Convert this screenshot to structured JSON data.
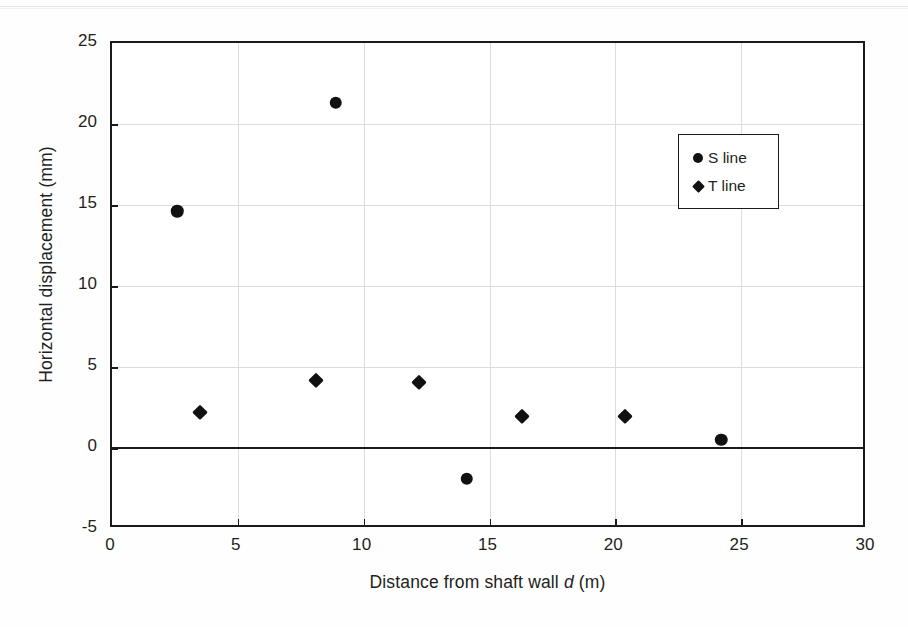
{
  "chart_data": {
    "type": "scatter",
    "title": "",
    "xlabel": "Distance from shaft wall d (m)",
    "xlabel_parts": {
      "pre": "Distance from shaft wall ",
      "italic": "d",
      "post": " (m)"
    },
    "ylabel": "Horizontal displacement (mm)",
    "xlim": [
      0,
      30
    ],
    "ylim": [
      -5,
      25
    ],
    "xticks": [
      "0",
      "5",
      "10",
      "15",
      "20",
      "25",
      "30"
    ],
    "yticks": [
      "25",
      "20",
      "15",
      "10",
      "5",
      "0",
      "-5"
    ],
    "xtick_values": [
      0,
      5,
      10,
      15,
      20,
      25,
      30
    ],
    "ytick_values": [
      25,
      20,
      15,
      10,
      5,
      0,
      -5
    ],
    "grid": true,
    "zero_line": true,
    "legend_position": "upper-right-inside",
    "marker_color": "#111111",
    "axis_color": "#1a1a1a",
    "grid_color": "#dcdcdc",
    "series": [
      {
        "name": "S line",
        "marker": "circle",
        "points": [
          {
            "x": 2.6,
            "y": 14.6
          },
          {
            "x": 8.9,
            "y": 21.3
          },
          {
            "x": 14.1,
            "y": -1.9
          },
          {
            "x": 24.2,
            "y": 0.5
          }
        ]
      },
      {
        "name": "T line",
        "marker": "diamond",
        "points": [
          {
            "x": 3.5,
            "y": 2.2
          },
          {
            "x": 8.1,
            "y": 4.2
          },
          {
            "x": 12.2,
            "y": 4.1
          },
          {
            "x": 16.3,
            "y": 2.0
          },
          {
            "x": 20.4,
            "y": 2.0
          }
        ]
      }
    ]
  },
  "legend": {
    "entries": [
      {
        "label": "S line",
        "marker": "circle"
      },
      {
        "label": "T line",
        "marker": "diamond"
      }
    ]
  }
}
